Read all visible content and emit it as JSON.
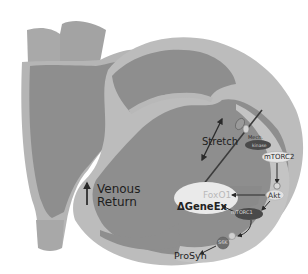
{
  "figure": {
    "type": "heart-signaling-diagram",
    "colors": {
      "chamber_fill": "#8e8e8e",
      "wall_fill": "#b8b8b8",
      "vessel_fill": "#a9a9a9",
      "membrane_line": "#3c3c3c",
      "node_dark": "#4a4a4a",
      "node_light": "#e6e6e6",
      "text_dark": "#1e1e1e",
      "text_faded": "#b9b9b9"
    }
  },
  "labels": {
    "stretch": "Stretch",
    "venous_line1": "Venous",
    "venous_line2": "Return",
    "prosyn": "ProSyn",
    "gene_expression": "ΔGeneEx",
    "foxo1": "FoxO1",
    "akt": "Akt",
    "mtorc2": "mTORC2",
    "mtorc1": "mTORC1",
    "mechano_kinase": "Mech.",
    "mechano_kinase_sub": "kinase",
    "s6k": "S6K"
  },
  "pathway": {
    "nodes": [
      "Stretch",
      "Mech. kinase",
      "mTORC2",
      "Akt",
      "FoxO1",
      "mTORC1",
      "ΔGeneEx",
      "S6K",
      "ProSyn"
    ],
    "edges": [
      [
        "Stretch",
        "Mech. kinase"
      ],
      [
        "Mech. kinase",
        "mTORC2"
      ],
      [
        "mTORC2",
        "Akt"
      ],
      [
        "Akt",
        "FoxO1"
      ],
      [
        "Akt",
        "mTORC1"
      ],
      [
        "mTORC1",
        "ΔGeneEx"
      ],
      [
        "mTORC1",
        "S6K"
      ],
      [
        "S6K",
        "ProSyn"
      ]
    ]
  }
}
